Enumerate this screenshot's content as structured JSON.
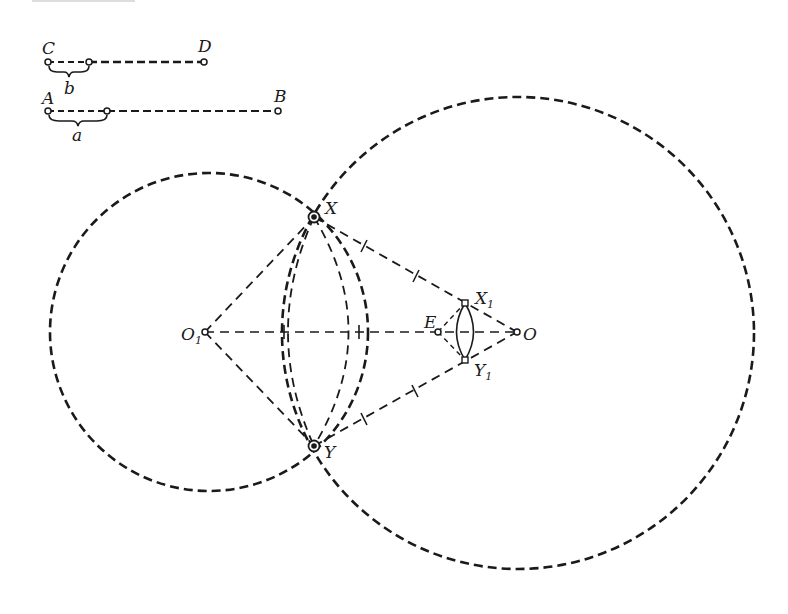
{
  "diagram": {
    "type": "geometric-construction",
    "colors": {
      "stroke": "#1a1a1a",
      "background": "#ffffff"
    },
    "segments": {
      "cd": {
        "start_label": "C",
        "end_label": "D",
        "part_label": "b"
      },
      "ab": {
        "start_label": "A",
        "end_label": "B",
        "part_label": "a"
      }
    },
    "points": {
      "o1": {
        "label": "O",
        "subscript": "1"
      },
      "o": {
        "label": "O"
      },
      "x": {
        "label": "X"
      },
      "y": {
        "label": "Y"
      },
      "x1": {
        "label": "X",
        "subscript": "1"
      },
      "y1": {
        "label": "Y",
        "subscript": "1"
      },
      "e": {
        "label": "E"
      }
    },
    "circles": [
      {
        "name": "circle-center-o1",
        "center": "O1",
        "radius_segment": "b"
      },
      {
        "name": "circle-center-o",
        "center": "O",
        "radius_segment": "a"
      }
    ]
  }
}
